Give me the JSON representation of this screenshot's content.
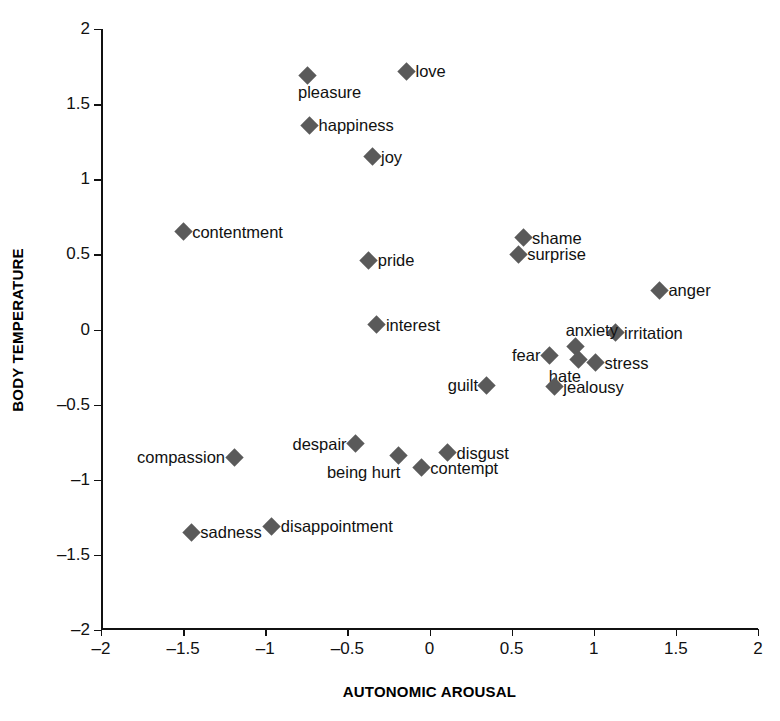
{
  "chart_data": {
    "type": "scatter",
    "title": "",
    "xlabel": "AUTONOMIC AROUSAL",
    "ylabel": "BODY TEMPERATURE",
    "xlim": [
      -2,
      2
    ],
    "ylim": [
      -2,
      2
    ],
    "grid": false,
    "legend": "none",
    "marker": {
      "shape": "diamond",
      "color": "#5a5a5a",
      "size": 13
    },
    "xticks": [
      -2,
      -1.5,
      -1,
      -0.5,
      0,
      0.5,
      1,
      1.5,
      2
    ],
    "xticklabels": [
      "–2",
      "–1.5",
      "–1",
      "–0.5",
      "0",
      "0.5",
      "1",
      "1.5",
      "2"
    ],
    "yticks": [
      -2,
      -1.5,
      -1,
      -0.5,
      0,
      0.5,
      1,
      1.5,
      2
    ],
    "yticklabels": [
      "–2",
      "–1.5",
      "–1",
      "–0.5",
      "0",
      "0.5",
      "1",
      "1.5",
      "2"
    ],
    "points": [
      {
        "label": "love",
        "x": -0.14,
        "y": 1.72,
        "label_pos": "right"
      },
      {
        "label": "pleasure",
        "x": -0.74,
        "y": 1.69,
        "label_pos": "below"
      },
      {
        "label": "happiness",
        "x": -0.73,
        "y": 1.36,
        "label_pos": "right"
      },
      {
        "label": "joy",
        "x": -0.35,
        "y": 1.15,
        "label_pos": "right"
      },
      {
        "label": "contentment",
        "x": -1.5,
        "y": 0.65,
        "label_pos": "right"
      },
      {
        "label": "shame",
        "x": 0.57,
        "y": 0.61,
        "label_pos": "right"
      },
      {
        "label": "surprise",
        "x": 0.54,
        "y": 0.5,
        "label_pos": "right"
      },
      {
        "label": "pride",
        "x": -0.37,
        "y": 0.46,
        "label_pos": "right"
      },
      {
        "label": "anger",
        "x": 1.4,
        "y": 0.26,
        "label_pos": "right"
      },
      {
        "label": "interest",
        "x": -0.32,
        "y": 0.03,
        "label_pos": "right"
      },
      {
        "label": "irritation",
        "x": 1.13,
        "y": -0.02,
        "label_pos": "right"
      },
      {
        "label": "anxiety",
        "x": 0.89,
        "y": -0.11,
        "label_pos": "above"
      },
      {
        "label": "hate",
        "x": 0.91,
        "y": -0.2,
        "label_pos": "below-left"
      },
      {
        "label": "fear",
        "x": 0.73,
        "y": -0.17,
        "label_pos": "left"
      },
      {
        "label": "stress",
        "x": 1.01,
        "y": -0.22,
        "label_pos": "right"
      },
      {
        "label": "guilt",
        "x": 0.35,
        "y": -0.37,
        "label_pos": "left"
      },
      {
        "label": "jealousy",
        "x": 0.76,
        "y": -0.38,
        "label_pos": "right"
      },
      {
        "label": "despair",
        "x": -0.45,
        "y": -0.76,
        "label_pos": "left"
      },
      {
        "label": "disgust",
        "x": 0.11,
        "y": -0.82,
        "label_pos": "right"
      },
      {
        "label": "being hurt",
        "x": -0.19,
        "y": -0.84,
        "label_pos": "below-left"
      },
      {
        "label": "compassion",
        "x": -1.19,
        "y": -0.85,
        "label_pos": "left"
      },
      {
        "label": "contempt",
        "x": -0.05,
        "y": -0.92,
        "label_pos": "right"
      },
      {
        "label": "disappointment",
        "x": -0.96,
        "y": -1.31,
        "label_pos": "right"
      },
      {
        "label": "sadness",
        "x": -1.45,
        "y": -1.35,
        "label_pos": "right"
      }
    ]
  }
}
